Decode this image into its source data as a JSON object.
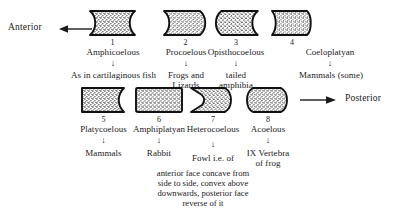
{
  "diagram": {
    "title_absent": true,
    "direction_labels": {
      "anterior": "Anterior",
      "posterior": "Posterior"
    },
    "arrows": {
      "anterior_icon": "arrow-left-icon",
      "posterior_icon": "arrow-right-icon",
      "down_glyph": "↓"
    },
    "rows": [
      {
        "row": 1,
        "items": [
          {
            "number": "1",
            "term": "Amphicoelous",
            "example": "As in cartilaginous fish",
            "shape": "biconcave"
          },
          {
            "number": "2",
            "term": "Procoelous",
            "example": "Frogs and\nLizards",
            "example_lines": [
              "Frogs and",
              "Lizards"
            ],
            "shape": "concave-convex"
          },
          {
            "number": "3",
            "term": "Opisthocoelous",
            "example": "tailed\namphibia",
            "example_lines": [
              "tailed",
              "amphibia"
            ],
            "shape": "convex-concave"
          },
          {
            "number": "4",
            "term": "Coeloplatyan",
            "example": "Mammals (some)",
            "example_lines": [
              "Mammals (some)"
            ],
            "shape": "concave-flat"
          }
        ]
      },
      {
        "row": 2,
        "items": [
          {
            "number": "5",
            "term": "Platycoelous",
            "example": "Mammals",
            "example_lines": [
              "Mammals"
            ],
            "shape": "flat-concave"
          },
          {
            "number": "6",
            "term": "Amphiplatyan",
            "example": "Rabbit",
            "example_lines": [
              "Rabbit"
            ],
            "shape": "biflat"
          },
          {
            "number": "7",
            "term": "Heterocoelous",
            "example": "Fowl i.e. of",
            "example_lines": [
              "Fowl i.e. of"
            ],
            "shape": "saddle"
          },
          {
            "number": "8",
            "term": "Acoelous",
            "example": "IX Vertebra\nof frog",
            "example_lines": [
              "IX Vertebra",
              "of frog"
            ],
            "shape": "biconvex"
          }
        ]
      }
    ],
    "note_lines": [
      "anterior face concave from",
      "side to side, convex above",
      "downwards, posterior face",
      "reverse of it"
    ],
    "colors": {
      "ink": "#1a1a1a",
      "background": "#ffffff",
      "stipple": "#222222"
    }
  }
}
